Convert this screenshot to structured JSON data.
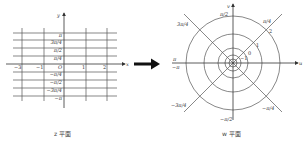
{
  "z_plane": {
    "caption": "z 平面",
    "axis_x": "x",
    "axis_y": "y",
    "origin": "O",
    "x_ticks": [
      {
        "label": "−3",
        "x": 20
      },
      {
        "label": "−1",
        "x": 41
      },
      {
        "label": "1",
        "x": 84
      },
      {
        "label": "2",
        "x": 106
      }
    ],
    "y_ticks": [
      {
        "label": "π",
        "y": 34
      },
      {
        "label": "3π/4",
        "y": 41
      },
      {
        "label": "π/2",
        "y": 49
      },
      {
        "label": "π/4",
        "y": 57
      },
      {
        "label": "−π/4",
        "y": 73
      },
      {
        "label": "−π/2",
        "y": 81
      },
      {
        "label": "−3π/4",
        "y": 89
      },
      {
        "label": "−π",
        "y": 97
      }
    ]
  },
  "arrow": {
    "direction": "right",
    "meaning": "maps to"
  },
  "w_plane": {
    "caption": "w 平面",
    "axis_x": "u",
    "axis_y": "v",
    "ray_labels": {
      "top": "π/2",
      "top_right": "π/4",
      "top_left": "3π/4",
      "left_upper": "π",
      "left_lower": "−π",
      "bottom_left": "−3π/4",
      "bottom": "−π/2",
      "bottom_right": "−π/4"
    },
    "circle_labels": [
      "2",
      "1",
      "0",
      "−1"
    ]
  }
}
